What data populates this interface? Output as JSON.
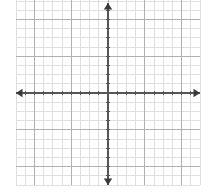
{
  "figure": {
    "kind": "blank-coordinate-grid",
    "title": "",
    "background_color": "#ffffff",
    "width": 215,
    "height": 192
  },
  "grid": {
    "minor_line_color": "#dcdcdc",
    "major_line_color": "#b0b0b0",
    "cell_size_px": 9.2,
    "columns": 20,
    "rows": 20,
    "left_px": 16,
    "right_px": 200,
    "top_px": -2,
    "bottom_px": 185,
    "major_every": 4,
    "show_grid": true
  },
  "axes": {
    "color": "#555555",
    "line_width_px": 1.6,
    "origin": {
      "x_px": 108,
      "y_px": 93
    },
    "x_axis": {
      "label": "",
      "y_px": 93,
      "start_px": 16,
      "end_px": 200,
      "arrow_start": true,
      "arrow_end": true,
      "ticks": true,
      "tick_count": 20,
      "tick_length_px": 4,
      "tick_labels": []
    },
    "y_axis": {
      "label": "",
      "x_px": 108,
      "start_px": 3,
      "end_px": 185,
      "arrow_start": true,
      "arrow_end": true,
      "ticks": true,
      "tick_count": 20,
      "tick_length_px": 4,
      "tick_labels": []
    }
  },
  "chart_data": {
    "type": "scatter",
    "title": "",
    "xlabel": "",
    "ylabel": "",
    "xlim": [
      -10,
      10
    ],
    "ylim": [
      -10,
      10
    ],
    "xticks": [
      -10,
      -9,
      -8,
      -7,
      -6,
      -5,
      -4,
      -3,
      -2,
      -1,
      0,
      1,
      2,
      3,
      4,
      5,
      6,
      7,
      8,
      9,
      10
    ],
    "yticks": [
      -10,
      -9,
      -8,
      -7,
      -6,
      -5,
      -4,
      -3,
      -2,
      -1,
      0,
      1,
      2,
      3,
      4,
      5,
      6,
      7,
      8,
      9,
      10
    ],
    "xtick_labels": [],
    "ytick_labels": [],
    "grid": true,
    "legend": false,
    "series": [],
    "annotations": []
  }
}
